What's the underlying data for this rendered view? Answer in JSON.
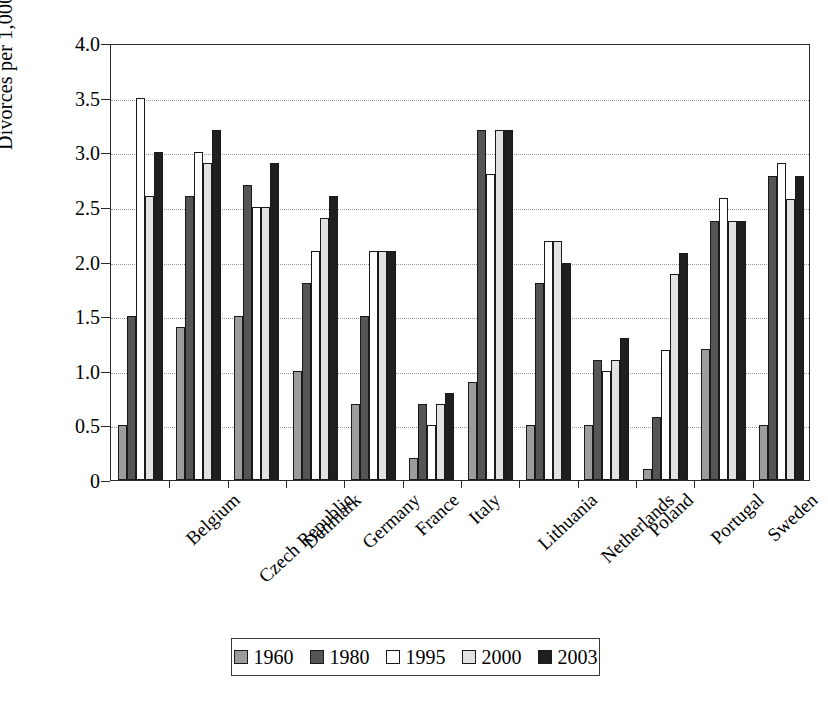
{
  "chart_data": {
    "type": "bar",
    "title": "",
    "xlabel": "",
    "ylabel": "Divorces per 1,000 people",
    "ylim": [
      0,
      4.0
    ],
    "ytick_labels": [
      "4.0",
      "3.5",
      "3.0",
      "2.5",
      "2.0",
      "1.5",
      "1.0",
      "0.5",
      "0"
    ],
    "ytick_values": [
      4.0,
      3.5,
      3.0,
      2.5,
      2.0,
      1.5,
      1.0,
      0.5,
      0
    ],
    "grid": true,
    "legend_position": "bottom",
    "categories": [
      "Belgium",
      "Czech Republic",
      "Denmark",
      "Germany",
      "France",
      "Italy",
      "Lithuania",
      "Netherlands",
      "Poland",
      "Portugal",
      "Sweden",
      "United Kingdom"
    ],
    "series": [
      {
        "name": "1960",
        "color": "#9c9c9c",
        "values": [
          0.5,
          1.4,
          1.5,
          1.0,
          0.7,
          0.2,
          0.9,
          0.5,
          0.5,
          0.1,
          1.2,
          0.5
        ]
      },
      {
        "name": "1980",
        "color": "#555555",
        "values": [
          1.5,
          2.6,
          2.7,
          1.8,
          1.5,
          0.7,
          3.2,
          1.8,
          1.1,
          0.58,
          2.37,
          2.78
        ]
      },
      {
        "name": "1995",
        "color": "#ffffff",
        "values": [
          3.5,
          3.0,
          2.5,
          2.1,
          2.1,
          0.5,
          2.8,
          2.19,
          1.0,
          1.19,
          2.58,
          2.9
        ]
      },
      {
        "name": "2000",
        "color": "#e2e2e2",
        "values": [
          2.6,
          2.9,
          2.5,
          2.4,
          2.1,
          0.7,
          3.2,
          2.19,
          1.1,
          1.89,
          2.37,
          2.57
        ]
      },
      {
        "name": "2003",
        "color": "#1f1f1f",
        "values": [
          3.0,
          3.2,
          2.9,
          2.6,
          2.1,
          0.8,
          3.2,
          1.99,
          1.3,
          2.08,
          2.37,
          2.78
        ]
      }
    ]
  },
  "legend": {
    "items": [
      {
        "label": "1960",
        "color": "#9c9c9c"
      },
      {
        "label": "1980",
        "color": "#555555"
      },
      {
        "label": "1995",
        "color": "#ffffff"
      },
      {
        "label": "2000",
        "color": "#e2e2e2"
      },
      {
        "label": "2003",
        "color": "#1f1f1f"
      }
    ]
  }
}
